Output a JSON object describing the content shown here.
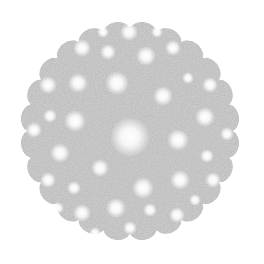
{
  "image": {
    "description": "Grayscale fractal-like disc with scalloped edge and scattered bright spots",
    "width": 264,
    "height": 264,
    "background": "#ffffff",
    "disc": {
      "cx": 130,
      "cy": 131,
      "radius": 110,
      "scallop_count": 24,
      "scallop_depth": 7,
      "fill": "#d2d2d2"
    },
    "blobs": [
      {
        "x": 130,
        "y": 137,
        "r": 20
      },
      {
        "x": 129,
        "y": 32,
        "r": 9
      },
      {
        "x": 146,
        "y": 56,
        "r": 10
      },
      {
        "x": 82,
        "y": 48,
        "r": 9
      },
      {
        "x": 108,
        "y": 52,
        "r": 8
      },
      {
        "x": 173,
        "y": 48,
        "r": 8
      },
      {
        "x": 157,
        "y": 32,
        "r": 6
      },
      {
        "x": 103,
        "y": 32,
        "r": 6
      },
      {
        "x": 117,
        "y": 83,
        "r": 12
      },
      {
        "x": 78,
        "y": 83,
        "r": 10
      },
      {
        "x": 48,
        "y": 85,
        "r": 9
      },
      {
        "x": 163,
        "y": 96,
        "r": 10
      },
      {
        "x": 188,
        "y": 78,
        "r": 6
      },
      {
        "x": 210,
        "y": 85,
        "r": 8
      },
      {
        "x": 75,
        "y": 121,
        "r": 11
      },
      {
        "x": 50,
        "y": 116,
        "r": 7
      },
      {
        "x": 34,
        "y": 130,
        "r": 8
      },
      {
        "x": 205,
        "y": 117,
        "r": 10
      },
      {
        "x": 178,
        "y": 140,
        "r": 11
      },
      {
        "x": 227,
        "y": 134,
        "r": 7
      },
      {
        "x": 60,
        "y": 153,
        "r": 10
      },
      {
        "x": 100,
        "y": 168,
        "r": 9
      },
      {
        "x": 207,
        "y": 156,
        "r": 7
      },
      {
        "x": 48,
        "y": 180,
        "r": 8
      },
      {
        "x": 74,
        "y": 188,
        "r": 7
      },
      {
        "x": 143,
        "y": 188,
        "r": 11
      },
      {
        "x": 180,
        "y": 180,
        "r": 10
      },
      {
        "x": 213,
        "y": 180,
        "r": 8
      },
      {
        "x": 116,
        "y": 208,
        "r": 10
      },
      {
        "x": 82,
        "y": 213,
        "r": 9
      },
      {
        "x": 150,
        "y": 210,
        "r": 7
      },
      {
        "x": 177,
        "y": 215,
        "r": 8
      },
      {
        "x": 130,
        "y": 228,
        "r": 7
      },
      {
        "x": 95,
        "y": 233,
        "r": 6
      },
      {
        "x": 58,
        "y": 208,
        "r": 6
      },
      {
        "x": 195,
        "y": 200,
        "r": 6
      }
    ]
  }
}
